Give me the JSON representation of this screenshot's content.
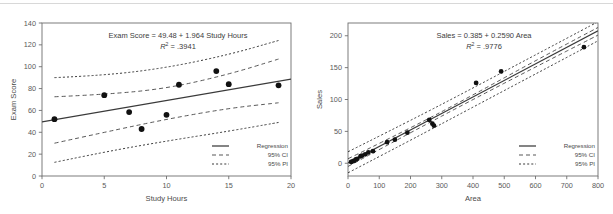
{
  "figure": {
    "title": "",
    "panel_count": 2
  },
  "chart_data": [
    {
      "id": "exam-score-vs-study-hours",
      "type": "scatter",
      "title": "",
      "annotation_equation": "Exam Score = 49.48 + 1.964 Study Hours",
      "annotation_r2_label": "R",
      "annotation_r2_sup": "2",
      "annotation_r2_value": "= .3941",
      "r_squared": 0.3941,
      "intercept": 49.48,
      "slope": 1.964,
      "xlabel": "Study Hours",
      "ylabel": "Exam Score",
      "xlim": [
        0,
        20
      ],
      "ylim": [
        0,
        140
      ],
      "xticks": [
        0,
        5,
        10,
        15,
        20
      ],
      "yticks": [
        0,
        20,
        40,
        60,
        80,
        100,
        120,
        140
      ],
      "grid": false,
      "n": 9,
      "x": [
        1,
        5,
        7,
        8,
        10,
        11,
        14,
        15,
        19
      ],
      "y": [
        52,
        74,
        58.5,
        43,
        56,
        83.5,
        96,
        84,
        83
      ],
      "points": [
        {
          "x": 1,
          "y": 52
        },
        {
          "x": 5,
          "y": 74
        },
        {
          "x": 7,
          "y": 58.5
        },
        {
          "x": 8,
          "y": 43
        },
        {
          "x": 10,
          "y": 56
        },
        {
          "x": 11,
          "y": 83.5
        },
        {
          "x": 14,
          "y": 96
        },
        {
          "x": 15,
          "y": 84
        },
        {
          "x": 19,
          "y": 83
        }
      ],
      "series": [
        {
          "name": "Regression",
          "style": "solid"
        },
        {
          "name": "95% CI",
          "style": "dashed"
        },
        {
          "name": "95% PI",
          "style": "dotted"
        }
      ],
      "ci_upper": [
        {
          "x": 1,
          "y": 72.5
        },
        {
          "x": 5,
          "y": 74.5
        },
        {
          "x": 10,
          "y": 80
        },
        {
          "x": 15,
          "y": 93
        },
        {
          "x": 19,
          "y": 107
        }
      ],
      "ci_lower": [
        {
          "x": 1,
          "y": 30
        },
        {
          "x": 5,
          "y": 40
        },
        {
          "x": 10,
          "y": 52
        },
        {
          "x": 15,
          "y": 62
        },
        {
          "x": 19,
          "y": 67
        }
      ],
      "pi_upper": [
        {
          "x": 1,
          "y": 90
        },
        {
          "x": 5,
          "y": 92
        },
        {
          "x": 10,
          "y": 99
        },
        {
          "x": 15,
          "y": 111
        },
        {
          "x": 19,
          "y": 124
        }
      ],
      "pi_lower": [
        {
          "x": 1,
          "y": 12.5
        },
        {
          "x": 5,
          "y": 22
        },
        {
          "x": 10,
          "y": 32
        },
        {
          "x": 15,
          "y": 41
        },
        {
          "x": 19,
          "y": 49
        }
      ],
      "legend_position": "bottom-right"
    },
    {
      "id": "sales-vs-area",
      "type": "scatter",
      "title": "",
      "annotation_equation": "Sales = 0.385 + 0.2590 Area",
      "annotation_r2_label": "R",
      "annotation_r2_sup": "2",
      "annotation_r2_value": "= .9776",
      "r_squared": 0.9776,
      "intercept": 0.385,
      "slope": 0.259,
      "xlabel": "Area",
      "ylabel": "Sales",
      "xlim": [
        0,
        800
      ],
      "ylim": [
        -20,
        220
      ],
      "xticks": [
        0,
        100,
        200,
        300,
        400,
        500,
        600,
        700,
        800
      ],
      "yticks": [
        0,
        50,
        100,
        150,
        200
      ],
      "grid": false,
      "n": 18,
      "x": [
        10,
        15,
        20,
        25,
        30,
        40,
        45,
        55,
        65,
        80,
        125,
        150,
        190,
        260,
        270,
        275,
        410,
        490,
        755
      ],
      "y": [
        2,
        3,
        4,
        6,
        7,
        11,
        12,
        14,
        17,
        19,
        33,
        37,
        48,
        68,
        62,
        59,
        126,
        144,
        182
      ],
      "points": [
        {
          "x": 10,
          "y": 2
        },
        {
          "x": 15,
          "y": 3
        },
        {
          "x": 20,
          "y": 4
        },
        {
          "x": 25,
          "y": 6
        },
        {
          "x": 30,
          "y": 7
        },
        {
          "x": 40,
          "y": 11
        },
        {
          "x": 45,
          "y": 12
        },
        {
          "x": 55,
          "y": 14
        },
        {
          "x": 65,
          "y": 17
        },
        {
          "x": 80,
          "y": 19
        },
        {
          "x": 125,
          "y": 33
        },
        {
          "x": 150,
          "y": 37
        },
        {
          "x": 190,
          "y": 48
        },
        {
          "x": 260,
          "y": 68
        },
        {
          "x": 270,
          "y": 62
        },
        {
          "x": 275,
          "y": 59
        },
        {
          "x": 410,
          "y": 126
        },
        {
          "x": 490,
          "y": 144
        },
        {
          "x": 755,
          "y": 182
        }
      ],
      "series": [
        {
          "name": "Regression",
          "style": "solid"
        },
        {
          "name": "95% CI",
          "style": "dashed"
        },
        {
          "name": "95% PI",
          "style": "dotted"
        }
      ],
      "ci_upper": [
        {
          "x": 0,
          "y": 7
        },
        {
          "x": 200,
          "y": 55
        },
        {
          "x": 400,
          "y": 107
        },
        {
          "x": 600,
          "y": 161
        },
        {
          "x": 800,
          "y": 213
        }
      ],
      "ci_lower": [
        {
          "x": 0,
          "y": -5
        },
        {
          "x": 200,
          "y": 48
        },
        {
          "x": 400,
          "y": 100
        },
        {
          "x": 600,
          "y": 151
        },
        {
          "x": 800,
          "y": 201
        }
      ],
      "pi_upper": [
        {
          "x": 0,
          "y": 18
        },
        {
          "x": 200,
          "y": 67
        },
        {
          "x": 400,
          "y": 118
        },
        {
          "x": 600,
          "y": 170
        },
        {
          "x": 800,
          "y": 222
        }
      ],
      "pi_lower": [
        {
          "x": 0,
          "y": -15
        },
        {
          "x": 200,
          "y": 36
        },
        {
          "x": 400,
          "y": 88
        },
        {
          "x": 600,
          "y": 140
        },
        {
          "x": 800,
          "y": 192
        }
      ],
      "legend_position": "bottom-right"
    }
  ],
  "legend": {
    "regression_label": "Regression",
    "ci_label": "95% CI",
    "pi_label": "95% PI"
  }
}
